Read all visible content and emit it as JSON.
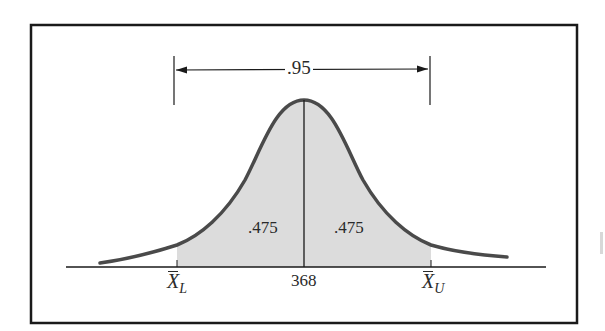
{
  "figure": {
    "type": "normal-distribution-confidence-interval",
    "total_area_label": ".95",
    "left_area_label": ".475",
    "right_area_label": ".475",
    "center_value_label": "368",
    "lower_bound_label": {
      "symbol": "X",
      "subscript": "L"
    },
    "upper_bound_label": {
      "symbol": "X",
      "subscript": "U"
    }
  },
  "colors": {
    "frame": "#1a1a1a",
    "curve": "#4a4a4a",
    "shade": "#dcdcdc",
    "axis": "#1a1a1a",
    "text": "#2a2a2a"
  }
}
